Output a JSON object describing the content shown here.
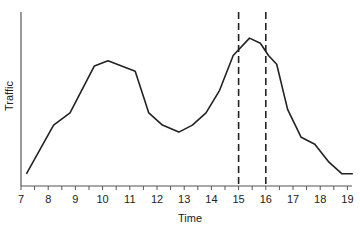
{
  "chart_data": {
    "type": "line",
    "title": "",
    "xlabel": "Time",
    "ylabel": "Traffic",
    "xlim": [
      7,
      19.3
    ],
    "x_ticks": [
      7,
      8,
      9,
      10,
      11,
      12,
      13,
      14,
      15,
      16,
      17,
      18,
      19
    ],
    "grid": false,
    "legend": null,
    "series": [
      {
        "name": "Traffic",
        "x": [
          7.2,
          8.2,
          8.8,
          9.7,
          10.2,
          11.2,
          11.7,
          12.2,
          12.8,
          13.3,
          13.8,
          14.3,
          14.8,
          15.4,
          15.8,
          16.1,
          16.4,
          16.8,
          17.3,
          17.8,
          18.3,
          18.8,
          19.2
        ],
        "y": [
          7,
          35,
          42,
          69,
          72,
          66,
          42,
          35,
          31,
          35,
          42,
          55,
          75,
          85,
          82,
          75,
          70,
          44,
          28,
          24,
          14,
          7,
          7
        ]
      }
    ],
    "annotations": [
      {
        "type": "vline",
        "x": 15,
        "style": "dashed"
      },
      {
        "type": "vline",
        "x": 16,
        "style": "dashed"
      }
    ]
  }
}
